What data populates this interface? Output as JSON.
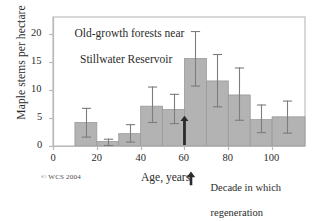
{
  "figure": {
    "title_line1": "Old-growth forests near",
    "title_line2": "Stillwater Reservoir",
    "copyright": "© WCS 2004",
    "legend": {
      "marker": "up-arrow",
      "line1": "Decade in which",
      "line2": "regeneration",
      "line3": "started to decrease",
      "marker_age": 60
    }
  },
  "chart_data": {
    "type": "bar",
    "title": "Old-growth forests near Stillwater Reservoir",
    "xlabel": "Age, years",
    "ylabel": "Maple stems per hectare",
    "xlim": [
      0,
      115
    ],
    "ylim": [
      0,
      23
    ],
    "xticks": [
      0,
      20,
      40,
      60,
      80,
      100
    ],
    "yticks": [
      0,
      5,
      10,
      15,
      20
    ],
    "grid": false,
    "legend_position": "below-right",
    "bar_color": "#b3b3b3",
    "bar_edge_color": "#9a9a9a",
    "errorbar_color": "#7d7d7d",
    "axis_color": "#b9b9b9",
    "bin_edges": [
      10,
      20,
      30,
      40,
      50,
      60,
      70,
      80,
      90,
      100,
      115
    ],
    "categories": [
      "10-20",
      "20-30",
      "30-40",
      "40-50",
      "50-60",
      "60-70",
      "70-80",
      "80-90",
      "90-100",
      "100-115"
    ],
    "bin_centers": [
      15,
      25,
      35,
      45,
      55,
      65,
      75,
      85,
      95,
      107
    ],
    "values": [
      4.2,
      0.8,
      2.2,
      7.1,
      6.5,
      15.6,
      11.6,
      9.1,
      4.7,
      5.2
    ],
    "error_low": [
      1.5,
      0.0,
      0.6,
      4.1,
      3.9,
      10.6,
      6.9,
      4.5,
      2.3,
      2.2
    ],
    "error_high": [
      6.8,
      1.3,
      3.9,
      10.6,
      9.3,
      20.5,
      16.4,
      14.0,
      7.4,
      8.1
    ]
  }
}
